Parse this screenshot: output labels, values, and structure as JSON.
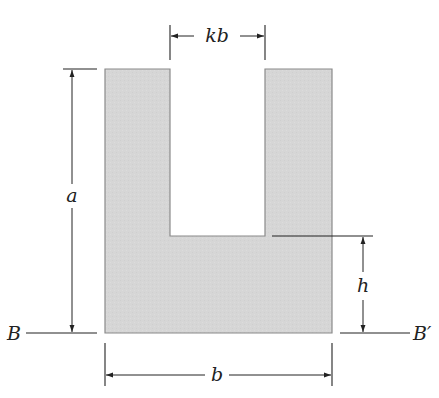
{
  "figure": {
    "colors": {
      "fill": "#d6d6d6",
      "outline": "#8a8a8a",
      "line": "#222222",
      "background": "#ffffff"
    },
    "labels": {
      "slot_width": "kb",
      "height": "a",
      "base_height": "h",
      "width": "b",
      "axis_left": "B",
      "axis_right": "B′"
    }
  }
}
